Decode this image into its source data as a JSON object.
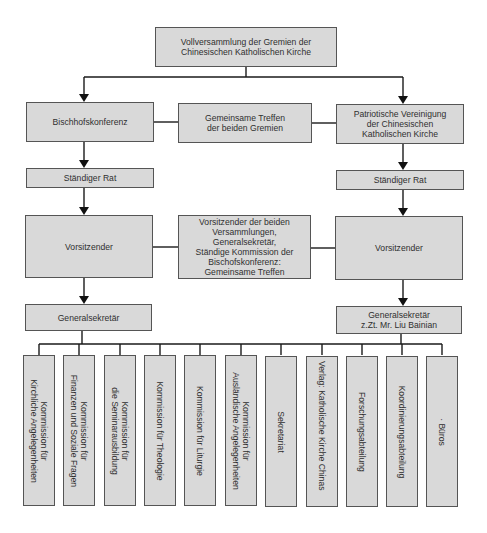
{
  "diagram": {
    "type": "org-chart",
    "top": {
      "label": "Vollversammlung der Gremien der\nChinesischen Katholischen Kirche"
    },
    "left_column": {
      "conference": "Bischhofskonferenz",
      "standing_council": "Ständiger Rat",
      "chair": "Vorsitzender",
      "secretary": "Generalsekretär"
    },
    "center_column": {
      "joint_meeting": "Gemeinsame Treffen\nder beiden Gremien",
      "joint_leadership": "Vorsitzender der beiden\nVersammlungen,\nGeneralsekretär,\nStändige Kommission der\nBischofskonferenz:\nGemeinsame Treffen"
    },
    "right_column": {
      "association": "Patriotische Vereinigung\nder Chinesischen\nKatholischen Kirche",
      "standing_council": "Ständiger Rat",
      "chair": "Vorsitzender",
      "secretary": "Generalsekretär\nz.Zt. Mr. Liu Bainian"
    },
    "departments": [
      "Kommission für\nKirchliche Angelegenheiten",
      "Kommission für\nFinanzen und Soziale Fragen",
      "Kommission für\ndie Seminarausbildung",
      "Kommission für Theologie",
      "Kommission für Liturgie",
      "Kommission für\nAusländische Angelegenheiten",
      "Sekretariat",
      "Verlag: Katholische Kirche Chinas",
      "Forschungsabteilung",
      "Koordinierungsabteilung",
      "· Büros"
    ],
    "colors": {
      "box_fill": "#d9d9d9",
      "box_border": "#555555",
      "text": "#2f2f2f",
      "connector": "#1a1a1a"
    }
  }
}
